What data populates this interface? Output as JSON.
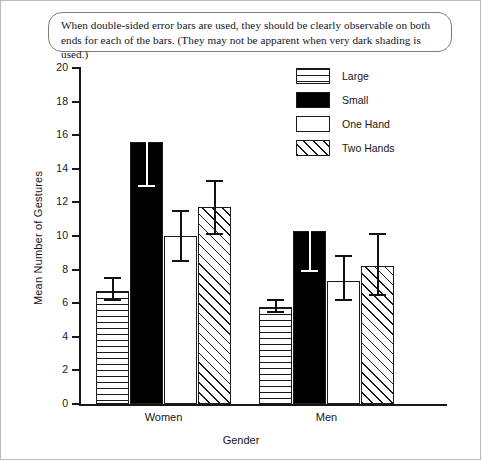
{
  "caption": {
    "text": "When double-sided error bars are used, they should be clearly observable on both ends for each of the bars. (They may not be apparent when very dark shading is used.)"
  },
  "legend": {
    "items": [
      {
        "label": "Large",
        "pattern": "horizontal-lines"
      },
      {
        "label": "Small",
        "pattern": "solid-black"
      },
      {
        "label": "One Hand",
        "pattern": "white"
      },
      {
        "label": "Two Hands",
        "pattern": "diagonal-lines"
      }
    ]
  },
  "chart_data": {
    "type": "bar",
    "title": "",
    "xlabel": "Gender",
    "ylabel": "Mean Number of Gestures",
    "categories": [
      "Women",
      "Men"
    ],
    "ylim": [
      0,
      20
    ],
    "yticks": [
      0,
      2,
      4,
      6,
      8,
      10,
      12,
      14,
      16,
      18,
      20
    ],
    "grid": false,
    "legend_position": "upper-right",
    "error_bars": "double-sided",
    "series": [
      {
        "name": "Large",
        "pattern": "horizontal-lines",
        "values": [
          6.7,
          5.8
        ],
        "err_low": [
          6.2,
          5.5
        ],
        "err_high": [
          7.5,
          6.2
        ]
      },
      {
        "name": "Small",
        "pattern": "solid-black",
        "values": [
          15.6,
          10.3
        ],
        "err_low": [
          13.0,
          7.9
        ],
        "err_high": [
          18.2,
          12.8
        ]
      },
      {
        "name": "One Hand",
        "pattern": "white",
        "values": [
          10.0,
          7.3
        ],
        "err_low": [
          8.5,
          6.2
        ],
        "err_high": [
          11.5,
          8.8
        ]
      },
      {
        "name": "Two Hands",
        "pattern": "diagonal-lines",
        "values": [
          11.7,
          8.2
        ],
        "err_low": [
          10.1,
          6.5
        ],
        "err_high": [
          13.3,
          10.1
        ]
      }
    ]
  }
}
